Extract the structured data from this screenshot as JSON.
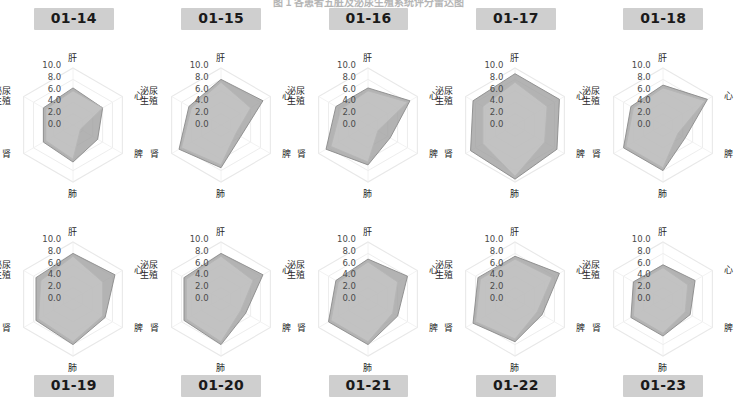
{
  "figure": {
    "title": "图 1   各患者五脏及泌尿生殖系统评分雷达图",
    "rows": 2,
    "cols": 5
  },
  "axis_labels": {
    "gan": "肝",
    "xin": "心",
    "pi": "脾",
    "fei": "肺",
    "shen": "肾",
    "miniao": "泌尿\n生殖",
    "miniao_line1": "泌尿",
    "miniao_line2": "生殖"
  },
  "ticks": [
    "10.0",
    "8.0",
    "6.0",
    "4.0",
    "2.0",
    "0.0"
  ],
  "colors": {
    "series_outer_fill": "#9e9e9e",
    "series_inner_fill": "#c8c8c8",
    "series_outer_line": "#8a8a8a",
    "series_inner_line": "#b5b5b5",
    "grid": "#e8e8e8",
    "spoke": "#efefef",
    "badge_bg": "#cfcfcf",
    "badge_text": "#1a1a1a",
    "tick_text": "#4a4a4a",
    "axis_text": "#1f1f1f"
  },
  "chart_data": {
    "type": "radar",
    "title": "图 1   各患者五脏及泌尿生殖系统评分雷达图",
    "categories": [
      "肝",
      "心",
      "脾",
      "肺",
      "肾",
      "泌尿生殖"
    ],
    "rlim": [
      0,
      10
    ],
    "rticks": [
      0,
      2,
      4,
      6,
      8,
      10
    ],
    "grid": true,
    "legend": "none",
    "panels": [
      {
        "label": "01-14",
        "label_position": "top",
        "series": [
          {
            "name": "外层",
            "values": [
              6.5,
              6.0,
              5.0,
              6.5,
              6.0,
              6.0
            ]
          },
          {
            "name": "内层",
            "values": [
              6.0,
              6.0,
              1.5,
              6.0,
              5.5,
              5.5
            ]
          }
        ]
      },
      {
        "label": "01-15",
        "label_position": "top",
        "series": [
          {
            "name": "外层",
            "values": [
              8.0,
              8.5,
              4.0,
              7.5,
              8.5,
              6.5
            ]
          },
          {
            "name": "内层",
            "values": [
              7.5,
              6.0,
              3.0,
              7.0,
              8.0,
              6.0
            ]
          }
        ]
      },
      {
        "label": "01-16",
        "label_position": "top",
        "series": [
          {
            "name": "外层",
            "values": [
              6.5,
              8.5,
              4.5,
              7.0,
              8.5,
              6.5
            ]
          },
          {
            "name": "内层",
            "values": [
              6.0,
              8.0,
              2.0,
              6.5,
              7.5,
              5.5
            ]
          }
        ]
      },
      {
        "label": "01-17",
        "label_position": "top",
        "series": [
          {
            "name": "外层",
            "values": [
              9.0,
              9.0,
              8.5,
              9.5,
              9.0,
              8.5
            ]
          },
          {
            "name": "内层",
            "values": [
              7.5,
              6.5,
              6.0,
              9.0,
              6.5,
              6.5
            ]
          }
        ]
      },
      {
        "label": "01-18",
        "label_position": "top",
        "series": [
          {
            "name": "外层",
            "values": [
              7.0,
              9.0,
              4.5,
              8.0,
              8.0,
              6.5
            ]
          },
          {
            "name": "内层",
            "values": [
              6.5,
              8.5,
              3.0,
              7.5,
              7.5,
              6.0
            ]
          }
        ]
      },
      {
        "label": "01-19",
        "label_position": "bottom",
        "series": [
          {
            "name": "外层",
            "values": [
              8.0,
              8.5,
              6.5,
              8.0,
              7.5,
              7.5
            ]
          },
          {
            "name": "内层",
            "values": [
              7.5,
              6.0,
              6.0,
              7.5,
              7.0,
              6.5
            ]
          }
        ]
      },
      {
        "label": "01-20",
        "label_position": "bottom",
        "series": [
          {
            "name": "外层",
            "values": [
              8.0,
              8.5,
              5.0,
              8.0,
              7.5,
              7.5
            ]
          },
          {
            "name": "内层",
            "values": [
              7.5,
              6.5,
              4.0,
              7.5,
              7.0,
              7.0
            ]
          }
        ]
      },
      {
        "label": "01-21",
        "label_position": "bottom",
        "series": [
          {
            "name": "外层",
            "values": [
              7.0,
              8.0,
              6.0,
              8.0,
              8.0,
              6.5
            ]
          },
          {
            "name": "内层",
            "values": [
              6.5,
              6.0,
              5.0,
              7.5,
              7.5,
              6.0
            ]
          }
        ]
      },
      {
        "label": "01-22",
        "label_position": "bottom",
        "series": [
          {
            "name": "外层",
            "values": [
              7.5,
              9.0,
              5.5,
              7.5,
              8.5,
              7.5
            ]
          },
          {
            "name": "内层",
            "values": [
              7.0,
              7.5,
              4.5,
              7.0,
              8.0,
              7.0
            ]
          }
        ]
      },
      {
        "label": "01-23",
        "label_position": "bottom",
        "series": [
          {
            "name": "外层",
            "values": [
              6.0,
              6.5,
              5.5,
              6.5,
              6.5,
              6.0
            ]
          },
          {
            "name": "内层",
            "values": [
              5.5,
              5.0,
              4.5,
              6.0,
              6.0,
              5.5
            ]
          }
        ]
      }
    ]
  }
}
